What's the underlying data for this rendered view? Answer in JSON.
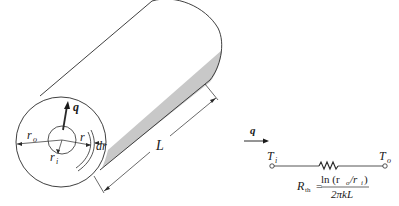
{
  "figure": {
    "cylinder": {
      "labels": {
        "heat_flow": "q",
        "outer_radius": "r",
        "outer_radius_sub": "o",
        "inner_radius": "r",
        "inner_radius_sub": "i",
        "radius": "r",
        "shell_thickness": "dr",
        "length": "L"
      },
      "shade_color": "#c8c8c8"
    },
    "circuit": {
      "heat_flow_label": "q",
      "inner_node": {
        "symbol": "T",
        "sub": "i"
      },
      "outer_node": {
        "symbol": "T",
        "sub": "o"
      },
      "resistance": {
        "symbol": "R",
        "sub": "th",
        "equals": "=",
        "numerator": "ln (r",
        "numerator_sub1": "o",
        "numerator_mid": "/r",
        "numerator_sub2": "i",
        "numerator_end": ")",
        "denominator": "2πkL"
      }
    }
  }
}
